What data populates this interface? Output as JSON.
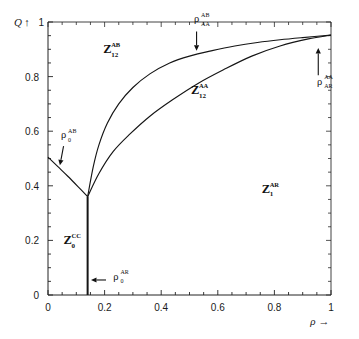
{
  "chart_data": {
    "type": "line",
    "title": "",
    "xlabel": "ρ",
    "ylabel": "Q",
    "xlim": [
      0,
      1
    ],
    "ylim": [
      0,
      1
    ],
    "grid": false,
    "legend": "none",
    "x_ticks": [
      "0",
      "0.2",
      "0.4",
      "0.6",
      "0.8",
      "1"
    ],
    "x_tick_values": [
      0,
      0.2,
      0.4,
      0.6,
      0.8,
      1
    ],
    "y_ticks": [
      "0",
      "0.2",
      "0.4",
      "0.6",
      "0.8",
      "1"
    ],
    "y_tick_values": [
      0,
      0.2,
      0.4,
      0.6,
      0.8,
      1
    ],
    "triple_point": [
      0.14,
      0.36
    ],
    "series": [
      {
        "name": "upper-phase-boundary",
        "description": "Boundary between Z12^AB and Z12^AA",
        "points": [
          [
            0.14,
            0.36
          ],
          [
            0.16,
            0.47
          ],
          [
            0.18,
            0.55
          ],
          [
            0.21,
            0.63
          ],
          [
            0.25,
            0.7
          ],
          [
            0.3,
            0.76
          ],
          [
            0.36,
            0.81
          ],
          [
            0.43,
            0.85
          ],
          [
            0.5,
            0.875
          ],
          [
            0.58,
            0.895
          ],
          [
            0.66,
            0.912
          ],
          [
            0.74,
            0.925
          ],
          [
            0.82,
            0.935
          ],
          [
            0.9,
            0.943
          ],
          [
            1.0,
            0.952
          ]
        ]
      },
      {
        "name": "lower-phase-boundary",
        "description": "Boundary between Z12^AA and Z1^AR",
        "points": [
          [
            0.14,
            0.36
          ],
          [
            0.18,
            0.445
          ],
          [
            0.23,
            0.525
          ],
          [
            0.29,
            0.59
          ],
          [
            0.36,
            0.655
          ],
          [
            0.44,
            0.715
          ],
          [
            0.53,
            0.775
          ],
          [
            0.62,
            0.825
          ],
          [
            0.72,
            0.875
          ],
          [
            0.82,
            0.912
          ],
          [
            0.92,
            0.938
          ],
          [
            1.0,
            0.952
          ]
        ]
      },
      {
        "name": "left-phase-boundary",
        "description": "Boundary from y-axis down to triple point",
        "points": [
          [
            0.0,
            0.505
          ],
          [
            0.035,
            0.47
          ],
          [
            0.07,
            0.435
          ],
          [
            0.105,
            0.398
          ],
          [
            0.14,
            0.36
          ]
        ]
      },
      {
        "name": "vertical-phase-boundary",
        "description": "Vertical line from triple point down to rho axis",
        "points": [
          [
            0.14,
            0.36
          ],
          [
            0.14,
            0.0
          ]
        ]
      }
    ],
    "regions": [
      {
        "id": "region-z12-ab",
        "base": "Z",
        "sub": "12",
        "sup": "AB",
        "x": 0.195,
        "y": 0.885
      },
      {
        "id": "region-z12-aa",
        "base": "Z",
        "sub": "12",
        "sup": "AA",
        "x": 0.505,
        "y": 0.735
      },
      {
        "id": "region-z1-ar",
        "base": "Z",
        "sub": "1",
        "sup": "AR",
        "x": 0.755,
        "y": 0.375
      },
      {
        "id": "region-z0-cc",
        "base": "Z",
        "sub": "0",
        "sup": "CC",
        "x": 0.055,
        "y": 0.185
      }
    ],
    "annotations": [
      {
        "id": "annotation-rho0-ab",
        "base": "ρ",
        "sub": "0",
        "sup": "AB",
        "label_x": 0.055,
        "label_y": 0.575,
        "arrow_from": [
          0.055,
          0.545
        ],
        "arrow_to": [
          0.042,
          0.475
        ],
        "direction": "down"
      },
      {
        "id": "annotation-rhoaa-ab",
        "base": "ρ",
        "sub": "AA",
        "sup": "AB",
        "label_x": 0.525,
        "label_y": 1.0,
        "arrow_from": [
          0.525,
          0.965
        ],
        "arrow_to": [
          0.525,
          0.895
        ],
        "direction": "down"
      },
      {
        "id": "annotation-rhoar-aa",
        "base": "ρ",
        "sub": "AR",
        "sup": "AA",
        "label_x": 0.96,
        "label_y": 0.77,
        "arrow_from": [
          0.955,
          0.805
        ],
        "arrow_to": [
          0.955,
          0.905
        ],
        "direction": "up"
      },
      {
        "id": "annotation-rho0-ar",
        "base": "ρ",
        "sub": "0",
        "sup": "AR",
        "label_x": 0.24,
        "label_y": 0.055,
        "arrow_from": [
          0.205,
          0.055
        ],
        "arrow_to": [
          0.152,
          0.055
        ],
        "direction": "left"
      }
    ]
  }
}
